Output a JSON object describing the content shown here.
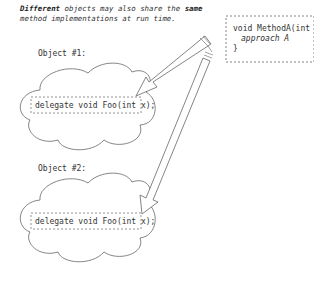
{
  "caption": {
    "bold1": "Different",
    "text1": " objects may also share the ",
    "bold2": "same",
    "text2": " method implementations at run time."
  },
  "method_box": {
    "line1": "void MethodA(int x) {",
    "line2": "approach A",
    "line3": "}"
  },
  "objects": [
    {
      "label": "Object #1:",
      "delegate": "delegate void Foo(int x);"
    },
    {
      "label": "Object #2:",
      "delegate": "delegate void Foo(int x);"
    }
  ],
  "colors": {
    "stroke": "#555555",
    "text": "#333333",
    "background": "#ffffff"
  }
}
